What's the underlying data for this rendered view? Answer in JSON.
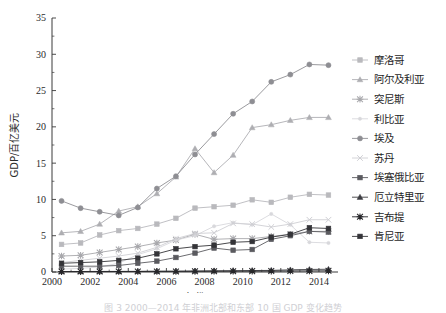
{
  "figure": {
    "top_partial_text": "",
    "caption": "图 3   2000—2014 年非洲北部和东部 10 国 GDP 变化趋势"
  },
  "axes": {
    "y_title": "GDP/百亿美元",
    "x_title": "年份",
    "y_ticks": [
      "0",
      "5",
      "10",
      "15",
      "20",
      "25",
      "30",
      "35"
    ],
    "x_ticks": [
      "2000",
      "2002",
      "2004",
      "2006",
      "2008",
      "2010",
      "2012",
      "2014"
    ],
    "ylim": [
      0,
      35
    ],
    "xlim": [
      2000,
      2015
    ]
  },
  "legend": {
    "items": [
      {
        "label": "摩洛哥",
        "color": "#b9b9bd",
        "marker": "square"
      },
      {
        "label": "阿尔及利亚",
        "color": "#aeaeb2",
        "marker": "triangle"
      },
      {
        "label": "突尼斯",
        "color": "#a8a8ac",
        "marker": "star"
      },
      {
        "label": "利比亚",
        "color": "#d8d8dc",
        "marker": "dot"
      },
      {
        "label": "埃及",
        "color": "#8e8e93",
        "marker": "circle"
      },
      {
        "label": "苏丹",
        "color": "#cfcfd4",
        "marker": "cross"
      },
      {
        "label": "埃塞俄比亚",
        "color": "#5a5a5f",
        "marker": "square"
      },
      {
        "label": "厄立特里亚",
        "color": "#3d3d42",
        "marker": "triangle"
      },
      {
        "label": "吉布提",
        "color": "#262629",
        "marker": "star"
      },
      {
        "label": "肯尼亚",
        "color": "#343438",
        "marker": "square"
      }
    ]
  },
  "chart_data": {
    "type": "line",
    "title": "",
    "xlabel": "年份",
    "ylabel": "GDP/百亿美元",
    "xlim": [
      2000,
      2015
    ],
    "ylim": [
      0,
      35
    ],
    "grid": false,
    "legend_position": "right",
    "x": [
      2000.5,
      2001.5,
      2002.5,
      2003.5,
      2004.5,
      2005.5,
      2006.5,
      2007.5,
      2008.5,
      2009.5,
      2010.5,
      2011.5,
      2012.5,
      2013.5,
      2014.5
    ],
    "series": [
      {
        "name": "摩洛哥",
        "color": "#b9b9bd",
        "marker": "square",
        "values": [
          3.8,
          4.0,
          5.1,
          5.7,
          6.0,
          6.6,
          7.4,
          8.8,
          9.0,
          9.2,
          9.95,
          9.6,
          10.3,
          10.7,
          10.6
        ]
      },
      {
        "name": "阿尔及利亚",
        "color": "#aeaeb2",
        "marker": "triangle",
        "values": [
          5.4,
          5.6,
          6.6,
          8.4,
          9.0,
          10.8,
          13.1,
          17.0,
          13.7,
          16.1,
          19.9,
          20.3,
          20.9,
          21.3,
          21.3
        ]
      },
      {
        "name": "突尼斯",
        "color": "#a8a8ac",
        "marker": "star",
        "values": [
          2.2,
          2.3,
          2.7,
          3.1,
          3.5,
          4.0,
          4.4,
          5.2,
          4.5,
          4.6,
          4.6,
          4.9,
          5.2,
          5.6,
          5.6
        ]
      },
      {
        "name": "利比亚",
        "color": "#d8d8dc",
        "marker": "dot",
        "values": [
          0.4,
          0.5,
          0.7,
          1.2,
          2.4,
          3.2,
          4.4,
          5.0,
          6.3,
          6.8,
          6.5,
          8.0,
          6.5,
          4.1,
          4.0
        ]
      },
      {
        "name": "埃及",
        "color": "#8e8e93",
        "marker": "circle",
        "values": [
          9.8,
          8.8,
          8.3,
          7.8,
          8.9,
          11.5,
          13.2,
          16.2,
          19.0,
          21.8,
          23.5,
          26.2,
          27.2,
          28.6,
          28.5
        ]
      },
      {
        "name": "苏丹",
        "color": "#cfcfd4",
        "marker": "cross",
        "values": [
          1.3,
          1.6,
          1.9,
          2.2,
          2.6,
          3.4,
          4.6,
          5.3,
          5.4,
          6.7,
          6.6,
          6.2,
          6.6,
          7.2,
          7.2
        ]
      },
      {
        "name": "埃塞俄比亚",
        "color": "#5a5a5f",
        "marker": "square",
        "values": [
          0.8,
          0.8,
          0.8,
          0.9,
          1.2,
          1.5,
          2.0,
          2.6,
          3.3,
          3.0,
          3.1,
          4.5,
          5.0,
          5.6,
          5.5
        ]
      },
      {
        "name": "厄立特里亚",
        "color": "#3d3d42",
        "marker": "triangle",
        "values": [
          0.07,
          0.07,
          0.08,
          0.08,
          0.09,
          0.11,
          0.12,
          0.14,
          0.17,
          0.18,
          0.2,
          0.22,
          0.3,
          0.35,
          0.38
        ]
      },
      {
        "name": "吉布提",
        "color": "#262629",
        "marker": "star",
        "values": [
          0.06,
          0.06,
          0.06,
          0.07,
          0.07,
          0.08,
          0.08,
          0.09,
          0.1,
          0.11,
          0.12,
          0.13,
          0.14,
          0.15,
          0.16
        ]
      },
      {
        "name": "肯尼亚",
        "color": "#343438",
        "marker": "square",
        "values": [
          1.2,
          1.3,
          1.4,
          1.6,
          1.9,
          2.5,
          3.2,
          3.5,
          3.7,
          4.1,
          4.2,
          4.8,
          5.2,
          6.1,
          6.0
        ]
      }
    ]
  }
}
